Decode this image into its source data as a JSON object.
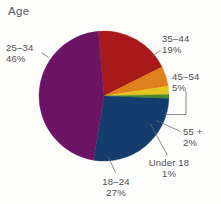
{
  "chart_data": {
    "type": "pie",
    "title": "Age",
    "xlabel": "",
    "ylabel": "",
    "legend_position": "none",
    "grid": false,
    "labels_show_percent": true,
    "start_angle_deg": 355,
    "direction": "clockwise",
    "categories": [
      "35–44",
      "45–54",
      "55 +",
      "Under 18",
      "18–24",
      "25–34"
    ],
    "values": [
      19,
      5,
      2,
      1,
      27,
      46
    ],
    "colors": [
      "#A8191A",
      "#E2801C",
      "#E3C521",
      "#4C8B2B",
      "#143C6C",
      "#6C1464"
    ],
    "slices": [
      {
        "label": "35–44",
        "percent": 19,
        "percent_text": "19%",
        "color": "#A8191A"
      },
      {
        "label": "45–54",
        "percent": 5,
        "percent_text": "5%",
        "color": "#E2801C"
      },
      {
        "label": "55 +",
        "percent": 2,
        "percent_text": "2%",
        "color": "#E3C521"
      },
      {
        "label": "Under 18",
        "percent": 1,
        "percent_text": "1%",
        "color": "#4C8B2B"
      },
      {
        "label": "18–24",
        "percent": 27,
        "percent_text": "27%",
        "color": "#143C6C"
      },
      {
        "label": "25–34",
        "percent": 46,
        "percent_text": "46%",
        "color": "#6C1464"
      }
    ]
  },
  "title": {
    "text": "Age"
  },
  "labels": {
    "age_25_34": {
      "name": "25–34",
      "percent": "46%"
    },
    "age_35_44": {
      "name": "35–44",
      "percent": "19%"
    },
    "age_45_54": {
      "name": "45–54",
      "percent": "5%"
    },
    "age_55_plus": {
      "name": "55 +",
      "percent": "2%"
    },
    "under_18": {
      "name": "Under 18",
      "percent": "1%"
    },
    "age_18_24": {
      "name": "18–24",
      "percent": "27%"
    }
  },
  "style": {
    "background": "#fdfdfb",
    "text_color": "#4f4f54",
    "leader_color": "#6d6d70"
  }
}
